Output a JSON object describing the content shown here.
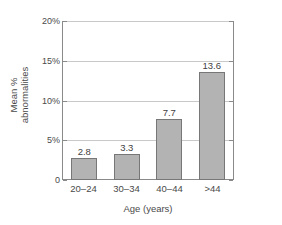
{
  "chart_data": {
    "type": "bar",
    "title": "",
    "subtitle": "",
    "categories": [
      "20–24",
      "30–34",
      "40–44",
      ">44"
    ],
    "values": [
      2.8,
      3.3,
      7.7,
      13.6
    ],
    "value_labels": [
      "2.8",
      "3.3",
      "7.7",
      "13.6"
    ],
    "xlabel": "Age (years)",
    "ylabel_line1": "Mean %",
    "ylabel_line2": "abnormalities",
    "ylabel": "Mean % abnormalities",
    "ylim": [
      0,
      20
    ],
    "yticks": [
      0,
      5,
      10,
      15,
      20
    ],
    "ytick_labels": [
      "0",
      "5%",
      "10%",
      "15%",
      "20%"
    ],
    "grid": true,
    "grid_axis": "y",
    "legend": false,
    "legend_position": "none",
    "colors": {
      "bar_fill": "#b3b3b3",
      "bar_stroke": "#777777",
      "gridline": "#c9c9c9",
      "axis": "#8a8a8a",
      "text": "#4a4a4a",
      "background": "#ffffff"
    }
  }
}
